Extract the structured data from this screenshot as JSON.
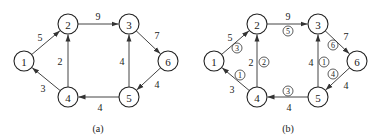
{
  "panels": [
    {
      "id": "a",
      "caption": "(a)",
      "offset_x": 0,
      "nodes": [
        {
          "id": "1",
          "label": "1",
          "x": 24,
          "y": 61
        },
        {
          "id": "2",
          "label": "2",
          "x": 68,
          "y": 24
        },
        {
          "id": "3",
          "label": "3",
          "x": 129,
          "y": 24
        },
        {
          "id": "4",
          "label": "4",
          "x": 68,
          "y": 97
        },
        {
          "id": "5",
          "label": "5",
          "x": 129,
          "y": 97
        },
        {
          "id": "6",
          "label": "6",
          "x": 168,
          "y": 61
        }
      ],
      "edges": [
        {
          "from": "1",
          "to": "2",
          "weight": "5",
          "wx": 40,
          "wy": 37
        },
        {
          "from": "2",
          "to": "3",
          "weight": "9",
          "wx": 98,
          "wy": 16
        },
        {
          "from": "3",
          "to": "6",
          "weight": "7",
          "wx": 157,
          "wy": 35
        },
        {
          "from": "6",
          "to": "5",
          "weight": "4",
          "wx": 157,
          "wy": 84
        },
        {
          "from": "5",
          "to": "4",
          "weight": "4",
          "wx": 100,
          "wy": 107
        },
        {
          "from": "4",
          "to": "1",
          "weight": "3",
          "wx": 43,
          "wy": 88
        },
        {
          "from": "4",
          "to": "2",
          "weight": "2",
          "wx": 60,
          "wy": 61
        },
        {
          "from": "5",
          "to": "3",
          "weight": "4",
          "wx": 122,
          "wy": 61
        }
      ]
    },
    {
      "id": "b",
      "caption": "(b)",
      "offset_x": 0,
      "nodes": [
        {
          "id": "1",
          "label": "1",
          "x": 214,
          "y": 61
        },
        {
          "id": "2",
          "label": "2",
          "x": 257,
          "y": 24
        },
        {
          "id": "3",
          "label": "3",
          "x": 318,
          "y": 24
        },
        {
          "id": "4",
          "label": "4",
          "x": 257,
          "y": 97
        },
        {
          "id": "5",
          "label": "5",
          "x": 318,
          "y": 97
        },
        {
          "id": "6",
          "label": "6",
          "x": 357,
          "y": 61
        }
      ],
      "edges": [
        {
          "from": "1",
          "to": "2",
          "weight": "5",
          "wx": 230,
          "wy": 37,
          "order": "3",
          "ox": 237,
          "oy": 48
        },
        {
          "from": "2",
          "to": "3",
          "weight": "9",
          "wx": 288,
          "wy": 16,
          "order": "5",
          "ox": 288,
          "oy": 31
        },
        {
          "from": "3",
          "to": "6",
          "weight": "7",
          "wx": 346,
          "wy": 36,
          "order": "6",
          "ox": 333,
          "oy": 45
        },
        {
          "from": "6",
          "to": "5",
          "weight": "4",
          "wx": 346,
          "wy": 85,
          "order": "4",
          "ox": 333,
          "oy": 74
        },
        {
          "from": "5",
          "to": "4",
          "weight": "4",
          "wx": 289,
          "wy": 107,
          "order": "3",
          "ox": 288,
          "oy": 91
        },
        {
          "from": "4",
          "to": "1",
          "weight": "3",
          "wx": 232,
          "wy": 89,
          "order": "1",
          "ox": 240,
          "oy": 75
        },
        {
          "from": "4",
          "to": "2",
          "weight": "2",
          "wx": 251,
          "wy": 62,
          "order": "2",
          "ox": 264,
          "oy": 62
        },
        {
          "from": "5",
          "to": "3",
          "weight": "4",
          "wx": 311,
          "wy": 62,
          "order": "1",
          "ox": 324,
          "oy": 62
        }
      ]
    }
  ],
  "captions": {
    "a": "(a)",
    "b": "(b)"
  },
  "node_radius": 10,
  "colors": {
    "stroke": "#222222",
    "edge": "#444444",
    "background": "#ffffff"
  }
}
